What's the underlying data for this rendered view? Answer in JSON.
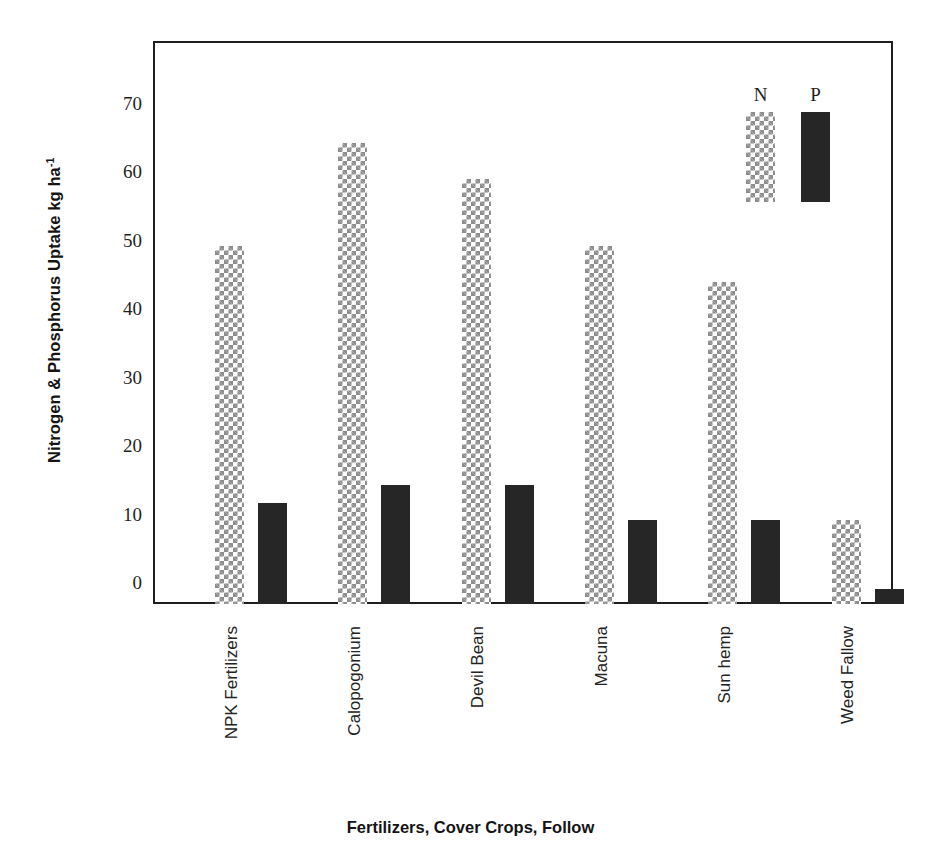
{
  "chart_data": {
    "type": "bar",
    "title": "",
    "xlabel": "Fertilizers, Cover Crops, Follow",
    "ylabel": "Nitrogen & Phosphorus Uptake kg ha",
    "ylabel_sup": "-1",
    "categories": [
      "NPK Fertilizers",
      "Calopogonium",
      "Devil Bean",
      "Macuna",
      "Sun hemp",
      "Weed Fallow"
    ],
    "series": [
      {
        "name": "N",
        "pattern": "checkered",
        "color": "#8d8d8d",
        "values": [
          52.3,
          67.3,
          62.0,
          52.2,
          47.0,
          12.2
        ]
      },
      {
        "name": "P",
        "pattern": "solid",
        "color": "#262626",
        "values": [
          14.7,
          17.3,
          17.3,
          12.2,
          12.2,
          2.2
        ]
      }
    ],
    "ylim": [
      0,
      76
    ],
    "yticks": [
      0,
      10,
      20,
      30,
      40,
      50,
      60,
      70
    ],
    "ytick_labels": [
      "0",
      "10",
      "20",
      "30",
      "40",
      "50",
      "60",
      "70"
    ],
    "grid": false,
    "legend_position": "inside top-right",
    "legend_entries": [
      "N",
      "P"
    ]
  }
}
